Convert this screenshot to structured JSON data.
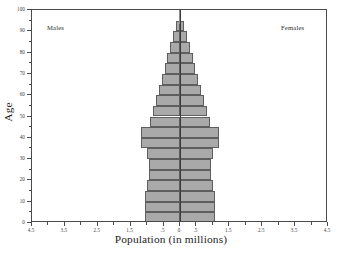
{
  "chart_data": {
    "type": "bar",
    "subtype": "population-pyramid",
    "title": "",
    "xlabel": "Population (in millions)",
    "ylabel": "Age",
    "xlim": [
      -4.5,
      4.5
    ],
    "ylim": [
      0,
      100
    ],
    "grid": false,
    "legend_position": "in-plot-top-corners",
    "x_axis_is_mirrored_absolute": true,
    "x_ticks_major": [
      -4.5,
      -3.5,
      -2.5,
      -1.5,
      -0.5,
      0,
      0.5,
      1.5,
      2.5,
      3.5,
      4.5
    ],
    "x_tick_labels": [
      "4.5",
      "3.5",
      "2.5",
      "1.5",
      ".5",
      "0",
      ".5",
      "1.5",
      "2.5",
      "3.5",
      "4.5"
    ],
    "x_ticks_minor": [
      -4.0,
      -3.0,
      -2.0,
      -1.0,
      1.0,
      2.0,
      3.0,
      4.0
    ],
    "y_ticks_major": [
      0,
      10,
      20,
      30,
      40,
      50,
      60,
      70,
      80,
      90,
      100
    ],
    "y_tick_labels": [
      "0",
      "10",
      "20",
      "30",
      "40",
      "50",
      "60",
      "70",
      "80",
      "90",
      "100"
    ],
    "y_ticks_minor": [
      5,
      15,
      25,
      35,
      45,
      55,
      65,
      75,
      85,
      95
    ],
    "age_band_width": 5,
    "categories": [
      "0-5",
      "5-10",
      "10-15",
      "15-20",
      "20-25",
      "25-30",
      "30-35",
      "35-40",
      "40-45",
      "45-50",
      "50-55",
      "55-60",
      "60-65",
      "65-70",
      "70-75",
      "75-80",
      "80-85",
      "85-90",
      "90-95",
      "95-100"
    ],
    "series": [
      {
        "name": "Males",
        "side": "left",
        "values": [
          1.05,
          1.07,
          1.05,
          1.0,
          0.95,
          0.95,
          1.0,
          1.2,
          1.2,
          0.9,
          0.82,
          0.72,
          0.63,
          0.55,
          0.47,
          0.4,
          0.3,
          0.2,
          0.12,
          0.04
        ]
      },
      {
        "name": "Females",
        "side": "right",
        "values": [
          1.05,
          1.07,
          1.05,
          1.0,
          0.95,
          0.95,
          1.0,
          1.2,
          1.2,
          0.9,
          0.82,
          0.72,
          0.63,
          0.55,
          0.47,
          0.4,
          0.3,
          0.2,
          0.12,
          0.04
        ]
      }
    ],
    "annotations": [
      {
        "text": "Males",
        "position": "top-left-inside-plot"
      },
      {
        "text": "Females",
        "position": "top-right-inside-plot"
      }
    ],
    "colors": {
      "bar_fill": "#a9a9a9",
      "bar_border": "#5e5e5e",
      "axis": "#4a4a4a",
      "text": "#232323",
      "background": "#ffffff"
    }
  },
  "labels": {
    "males": "Males",
    "females": "Females",
    "x_title": "Population (in millions)",
    "y_title": "Age"
  }
}
